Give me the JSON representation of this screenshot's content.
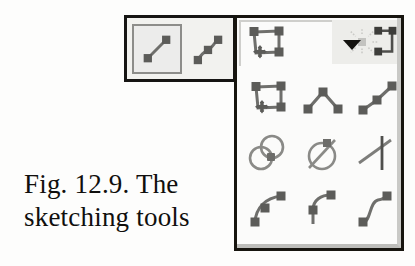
{
  "figure": {
    "caption_line1": "Fig. 12.9. The",
    "caption_line2": "sketching tools",
    "caption_full": "Fig. 12.9. The sketching tools",
    "figure_number": "12.9"
  },
  "colors": {
    "page_background": "#fdfdfc",
    "border_dark": "#17150f",
    "icon_stroke": "#6f6f6c",
    "icon_node": "#5c5c59",
    "toolbar_face": "#f2f2ef",
    "palette_face": "#fbfbfa",
    "selected_border": "#8d8d8a",
    "header_faded": "#ededea",
    "caption_text": "#100f0d"
  },
  "toolbar": {
    "name": "sketch-toolbar",
    "buttons": [
      {
        "label": "Line",
        "icon": "line-segment-icon",
        "selected": true
      },
      {
        "label": "Spline",
        "icon": "spline-curve-icon",
        "selected": false
      }
    ]
  },
  "palette": {
    "name": "sketching-tools-flyout",
    "header": {
      "current_tool_label": "Sketch Polygon",
      "current_tool_icon": "polygon-move-icon",
      "dropdown_icon": "chevron-down-icon",
      "faded_tools": [
        {
          "label": "Move / Pan",
          "icon": "move-starburst-icon",
          "enabled": false
        },
        {
          "label": "Polygon",
          "icon": "polygon-partial-icon",
          "enabled": false
        }
      ]
    },
    "rows": [
      {
        "row": 1,
        "items": [
          {
            "label": "Sketch Polygon",
            "icon": "polygon-move-icon"
          },
          {
            "label": "Angle / Polyline",
            "icon": "angle-polyline-icon"
          },
          {
            "label": "Two-Segment Line",
            "icon": "two-segment-line-icon"
          }
        ]
      },
      {
        "row": 2,
        "items": [
          {
            "label": "Tangent Circles",
            "icon": "overlapping-circles-icon"
          },
          {
            "label": "Circle with Chord",
            "icon": "circle-diagonal-icon"
          },
          {
            "label": "Intersection / Cross",
            "icon": "cross-intersection-icon"
          }
        ]
      },
      {
        "row": 3,
        "items": [
          {
            "label": "Arc Spline",
            "icon": "arc-spline-icon"
          },
          {
            "label": "Tangent Arc",
            "icon": "tangent-arc-icon"
          },
          {
            "label": "S-Curve Spline",
            "icon": "s-curve-spline-icon"
          }
        ]
      }
    ]
  }
}
